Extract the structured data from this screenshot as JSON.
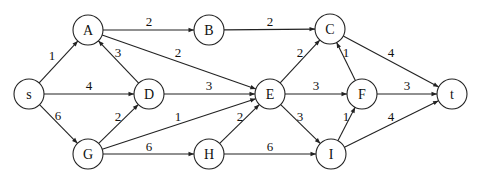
{
  "graph": {
    "directed": true,
    "node_radius": 15,
    "nodes": [
      {
        "id": "s",
        "label": "s",
        "x": 29,
        "y": 94
      },
      {
        "id": "A",
        "label": "A",
        "x": 88,
        "y": 30
      },
      {
        "id": "B",
        "label": "B",
        "x": 209,
        "y": 30
      },
      {
        "id": "C",
        "label": "C",
        "x": 330,
        "y": 29
      },
      {
        "id": "D",
        "label": "D",
        "x": 149,
        "y": 94
      },
      {
        "id": "E",
        "label": "E",
        "x": 270,
        "y": 94
      },
      {
        "id": "F",
        "label": "F",
        "x": 362,
        "y": 94
      },
      {
        "id": "t",
        "label": "t",
        "x": 452,
        "y": 94
      },
      {
        "id": "G",
        "label": "G",
        "x": 88,
        "y": 154
      },
      {
        "id": "H",
        "label": "H",
        "x": 209,
        "y": 154
      },
      {
        "id": "I",
        "label": "I",
        "x": 331,
        "y": 154
      }
    ],
    "edges": [
      {
        "from": "s",
        "to": "A",
        "weight": "1",
        "lx": 52,
        "ly": 55
      },
      {
        "from": "s",
        "to": "D",
        "weight": "4",
        "lx": 89,
        "ly": 85
      },
      {
        "from": "s",
        "to": "G",
        "weight": "6",
        "lx": 58,
        "ly": 115
      },
      {
        "from": "A",
        "to": "B",
        "weight": "2",
        "lx": 149,
        "ly": 21
      },
      {
        "from": "A",
        "to": "E",
        "weight": "2",
        "lx": 178,
        "ly": 52
      },
      {
        "from": "D",
        "to": "A",
        "weight": "3",
        "lx": 118,
        "ly": 52
      },
      {
        "from": "B",
        "to": "C",
        "weight": "2",
        "lx": 270,
        "ly": 21
      },
      {
        "from": "D",
        "to": "E",
        "weight": "3",
        "lx": 209,
        "ly": 85
      },
      {
        "from": "G",
        "to": "D",
        "weight": "2",
        "lx": 118,
        "ly": 116
      },
      {
        "from": "G",
        "to": "E",
        "weight": "1",
        "lx": 178,
        "ly": 116
      },
      {
        "from": "G",
        "to": "H",
        "weight": "6",
        "lx": 149,
        "ly": 146
      },
      {
        "from": "H",
        "to": "E",
        "weight": "2",
        "lx": 240,
        "ly": 116
      },
      {
        "from": "E",
        "to": "C",
        "weight": "2",
        "lx": 300,
        "ly": 52
      },
      {
        "from": "E",
        "to": "F",
        "weight": "3",
        "lx": 316,
        "ly": 85
      },
      {
        "from": "E",
        "to": "I",
        "weight": "3",
        "lx": 300,
        "ly": 116
      },
      {
        "from": "F",
        "to": "C",
        "weight": "1",
        "lx": 346,
        "ly": 52
      },
      {
        "from": "C",
        "to": "t",
        "weight": "4",
        "lx": 391,
        "ly": 52
      },
      {
        "from": "F",
        "to": "t",
        "weight": "3",
        "lx": 407,
        "ly": 85
      },
      {
        "from": "H",
        "to": "I",
        "weight": "6",
        "lx": 270,
        "ly": 146
      },
      {
        "from": "I",
        "to": "F",
        "weight": "1",
        "lx": 346,
        "ly": 116
      },
      {
        "from": "I",
        "to": "t",
        "weight": "4",
        "lx": 391,
        "ly": 116
      }
    ]
  }
}
